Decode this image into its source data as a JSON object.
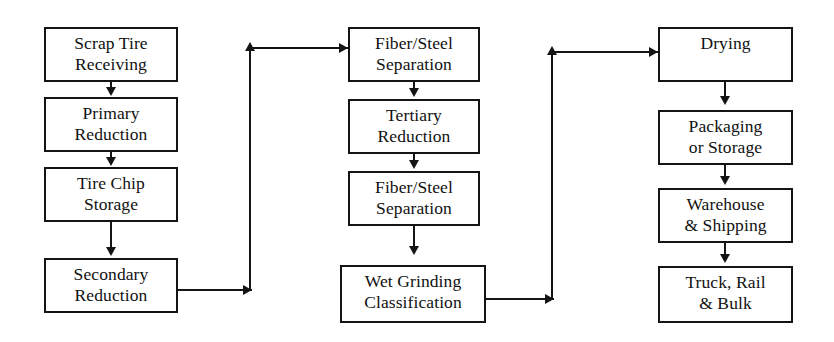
{
  "diagram": {
    "type": "flowchart",
    "orientation": "three-column serpentine",
    "colors": {
      "background": "#ffffff",
      "stroke": "#141414",
      "text": "#111111"
    },
    "columns": [
      {
        "id": "column-1",
        "nodes": [
          {
            "id": "scrap-tire-receiving",
            "lines": [
              "Scrap Tire",
              "Receiving"
            ]
          },
          {
            "id": "primary-reduction",
            "lines": [
              "Primary",
              "Reduction"
            ]
          },
          {
            "id": "tire-chip-storage",
            "lines": [
              "Tire Chip",
              "Storage"
            ]
          },
          {
            "id": "secondary-reduction",
            "lines": [
              "Secondary",
              "Reduction"
            ]
          }
        ]
      },
      {
        "id": "column-2",
        "nodes": [
          {
            "id": "fiber-steel-separation-1",
            "lines": [
              "Fiber/Steel",
              "Separation"
            ]
          },
          {
            "id": "tertiary-reduction",
            "lines": [
              "Tertiary",
              "Reduction"
            ]
          },
          {
            "id": "fiber-steel-separation-2",
            "lines": [
              "Fiber/Steel",
              "Separation"
            ]
          },
          {
            "id": "wet-grinding-classification",
            "lines": [
              "Wet Grinding",
              "Classification"
            ]
          }
        ]
      },
      {
        "id": "column-3",
        "nodes": [
          {
            "id": "drying",
            "lines": [
              "Drying"
            ]
          },
          {
            "id": "packaging-or-storage",
            "lines": [
              "Packaging",
              "or Storage"
            ]
          },
          {
            "id": "warehouse-shipping",
            "lines": [
              "Warehouse",
              "& Shipping"
            ]
          },
          {
            "id": "truck-rail-bulk",
            "lines": [
              "Truck, Rail",
              "& Bulk"
            ]
          }
        ]
      }
    ],
    "connections": [
      {
        "from": "scrap-tire-receiving",
        "to": "primary-reduction",
        "kind": "vertical-arrow"
      },
      {
        "from": "primary-reduction",
        "to": "tire-chip-storage",
        "kind": "vertical-arrow"
      },
      {
        "from": "tire-chip-storage",
        "to": "secondary-reduction",
        "kind": "vertical-arrow"
      },
      {
        "from": "secondary-reduction",
        "to": "fiber-steel-separation-1",
        "kind": "right-up-right-elbow"
      },
      {
        "from": "fiber-steel-separation-1",
        "to": "tertiary-reduction",
        "kind": "vertical-arrow"
      },
      {
        "from": "tertiary-reduction",
        "to": "fiber-steel-separation-2",
        "kind": "vertical-arrow"
      },
      {
        "from": "fiber-steel-separation-2",
        "to": "wet-grinding-classification",
        "kind": "vertical-arrow"
      },
      {
        "from": "wet-grinding-classification",
        "to": "drying",
        "kind": "right-up-right-elbow"
      },
      {
        "from": "drying",
        "to": "packaging-or-storage",
        "kind": "vertical-arrow"
      },
      {
        "from": "packaging-or-storage",
        "to": "warehouse-shipping",
        "kind": "vertical-arrow"
      },
      {
        "from": "warehouse-shipping",
        "to": "truck-rail-bulk",
        "kind": "vertical-arrow"
      }
    ]
  }
}
